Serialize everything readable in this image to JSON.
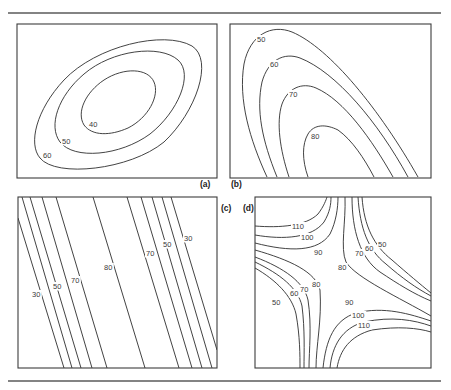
{
  "figure": {
    "colors": {
      "line": "#2e2e2e",
      "frame": "#3c3c3c",
      "rule": "#5a5a5a",
      "background": "#ffffff"
    },
    "rules": [
      {
        "name": "top-rule",
        "x1": 8,
        "y1": 13,
        "x2": 441,
        "y2": 13
      },
      {
        "name": "bottom-rule",
        "x1": 8,
        "y1": 381,
        "x2": 441,
        "y2": 381
      }
    ],
    "panels": [
      {
        "id": "a",
        "label": "(a)",
        "label_pos": [
          200,
          187
        ],
        "frame": {
          "x": 17,
          "y": 24,
          "w": 200,
          "h": 154
        },
        "contours": [
          {
            "value": "40",
            "d": "M 84 125 C 76 112 86 92 104 80 C 124 67 148 68 154 82 C 160 96 148 118 128 128 C 110 136 92 136 84 125 Z",
            "label_pos": [
              89,
              127
            ]
          },
          {
            "value": "50",
            "d": "M 60 142 C 48 126 58 96 84 74 C 112 50 160 44 178 60 C 194 74 178 112 150 134 C 120 156 74 160 60 142 Z",
            "label_pos": [
              62,
              144
            ]
          },
          {
            "value": "60",
            "d": "M 40 158 C 28 144 36 110 64 80 C 96 46 164 30 192 46 C 214 60 196 112 164 142 C 130 170 56 178 40 158 Z",
            "label_pos": [
              43,
              158
            ]
          }
        ]
      },
      {
        "id": "b",
        "label": "(b)",
        "label_pos": [
          231,
          187
        ],
        "frame": {
          "x": 230,
          "y": 24,
          "w": 201,
          "h": 154
        },
        "contours": [
          {
            "value": "50",
            "d": "M 267 177 C 250 140 238 100 244 64 C 250 34 272 24 292 32 C 330 48 380 110 418 177",
            "label_pos": [
              257,
              42
            ]
          },
          {
            "value": "60",
            "d": "M 277 177 C 262 140 256 110 262 82 C 268 60 284 52 300 58 C 336 72 378 122 408 177",
            "label_pos": [
              270,
              67
            ]
          },
          {
            "value": "70",
            "d": "M 289 177 C 280 150 276 122 282 104 C 288 88 302 82 316 88 C 344 100 372 140 393 177",
            "label_pos": [
              289,
              97
            ]
          },
          {
            "value": "80",
            "d": "M 308 177 C 302 160 302 144 308 134 C 314 124 326 124 338 130 C 352 140 364 158 374 177",
            "label_pos": [
              311,
              139
            ]
          }
        ]
      },
      {
        "id": "c",
        "label": "(c)",
        "label_pos": [
          221,
          211
        ],
        "frame": {
          "x": 18,
          "y": 197,
          "w": 199,
          "h": 171
        },
        "contours": [
          {
            "value": "30",
            "d": "M 18 218 L 64 368",
            "label_pos": [
              32,
              297
            ]
          },
          {
            "value": "",
            "d": "M 22 197 L 72 368",
            "label_pos": null
          },
          {
            "value": "50",
            "d": "M 30 197 L 81 368",
            "label_pos": [
              53,
              289
            ]
          },
          {
            "value": "",
            "d": "M 42 197 L 92 368",
            "label_pos": null
          },
          {
            "value": "70",
            "d": "M 56 197 L 107 368",
            "label_pos": [
              71,
              283
            ]
          },
          {
            "value": "80",
            "d": "M 93 197 L 145 368",
            "label_pos": [
              104,
              270
            ]
          },
          {
            "value": "70",
            "d": "M 127 197 L 179 368",
            "label_pos": [
              146,
              256
            ]
          },
          {
            "value": "",
            "d": "M 141 197 L 192 368",
            "label_pos": null
          },
          {
            "value": "50",
            "d": "M 152 197 L 202 368",
            "label_pos": [
              163,
              247
            ]
          },
          {
            "value": "",
            "d": "M 162 197 L 212 368",
            "label_pos": null
          },
          {
            "value": "30",
            "d": "M 171 197 L 217 350",
            "label_pos": [
              184,
              241
            ]
          }
        ]
      },
      {
        "id": "d",
        "label": "(d)",
        "label_pos": [
          243,
          211
        ],
        "frame": {
          "x": 255,
          "y": 197,
          "w": 176,
          "h": 171
        },
        "contours": [
          {
            "value": "110",
            "d": "M 255 226 C 280 228 306 226 318 214 C 324 206 326 200 327 197",
            "label_pos": [
              292,
              229
            ]
          },
          {
            "value": "100",
            "d": "M 255 235 C 284 240 312 238 324 222 C 330 212 331 204 331 197",
            "label_pos": [
              301,
              240
            ]
          },
          {
            "value": "90",
            "d": "M 255 243 C 290 252 318 252 330 234 C 336 222 338 208 338 197",
            "label_pos": [
              314,
              255
            ]
          },
          {
            "value": "80",
            "d": "M 345 197 C 346 222 340 248 346 262 C 356 278 400 298 431 316",
            "label_pos": [
              338,
              270
            ]
          },
          {
            "value": "70",
            "d": "M 352 197 C 352 230 360 258 380 272 C 398 284 414 294 431 301",
            "label_pos": [
              355,
              256
            ]
          },
          {
            "value": "60",
            "d": "M 358 197 C 360 228 368 250 386 264 C 402 278 416 288 431 296",
            "label_pos": [
              365,
              251
            ]
          },
          {
            "value": "50",
            "d": "M 362 197 C 364 226 374 246 392 260 C 408 274 420 284 431 293",
            "label_pos": [
              378,
              247
            ]
          },
          {
            "value": "80",
            "d": "M 255 250 C 290 260 316 272 320 290 C 322 320 316 346 316 368",
            "label_pos": [
              312,
              287
            ]
          },
          {
            "value": "70",
            "d": "M 255 257 C 284 268 304 282 308 300 C 312 326 309 350 309 368",
            "label_pos": [
              300,
              292
            ]
          },
          {
            "value": "60",
            "d": "M 255 262 C 280 274 298 288 302 306 C 305 330 304 352 304 368",
            "label_pos": [
              290,
              296
            ]
          },
          {
            "value": "50",
            "d": "M 255 268 C 276 280 292 296 296 314 C 300 336 300 356 300 368",
            "label_pos": [
              272,
              305
            ]
          },
          {
            "value": "90",
            "d": "M 323 368 C 326 340 334 320 356 313 C 384 306 410 314 431 321",
            "label_pos": [
              345,
              305
            ]
          },
          {
            "value": "100",
            "d": "M 330 368 C 332 346 342 328 364 322 C 392 316 414 320 431 326",
            "label_pos": [
              352,
              318
            ]
          },
          {
            "value": "110",
            "d": "M 337 368 C 340 350 350 336 372 330 C 398 326 418 328 431 332",
            "label_pos": [
              358,
              328
            ]
          }
        ]
      }
    ]
  }
}
